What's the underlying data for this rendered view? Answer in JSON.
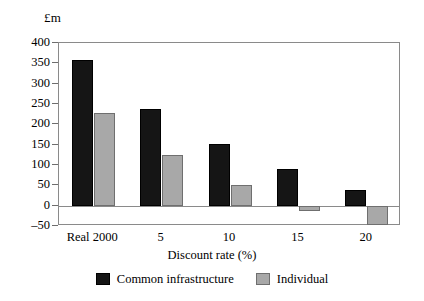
{
  "chart_data": {
    "type": "bar",
    "title": "",
    "subtitle": "",
    "unit_label": "£m",
    "xlabel": "Discount rate (%)",
    "ylabel": "",
    "categories": [
      "Real 2000",
      "5",
      "10",
      "15",
      "20"
    ],
    "series": [
      {
        "name": "Common infrastructure",
        "color": "#151515",
        "values": [
          357,
          238,
          152,
          90,
          38
        ]
      },
      {
        "name": "Individual",
        "color": "#a8a8a8",
        "values": [
          227,
          125,
          50,
          -12,
          -48
        ]
      }
    ],
    "ylim": [
      -50,
      400
    ],
    "ytick_values": [
      400,
      350,
      300,
      250,
      200,
      150,
      100,
      50,
      0,
      -50
    ],
    "ytick_labels": [
      "400",
      "350",
      "300",
      "250",
      "200",
      "150",
      "100",
      "50",
      "0",
      "–50"
    ],
    "grid": false,
    "legend_position": "bottom",
    "zero_line": true,
    "frame": true,
    "annotations": []
  },
  "legend": {
    "items": [
      {
        "label": "Common infrastructure",
        "swatch": "black"
      },
      {
        "label": "Individual",
        "swatch": "gray"
      }
    ]
  }
}
